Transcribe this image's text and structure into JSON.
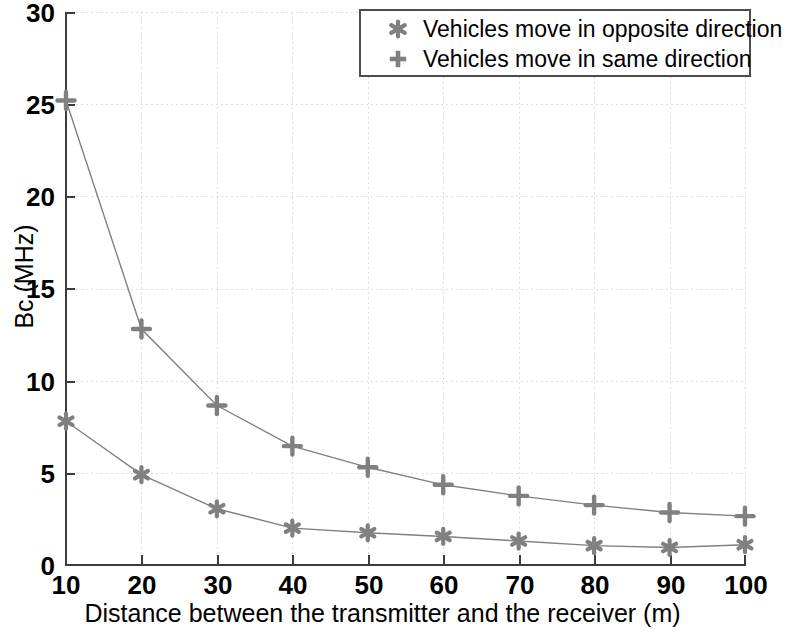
{
  "chart_data": {
    "type": "line",
    "title": "",
    "xlabel": "Distance between the transmitter and the receiver (m)",
    "ylabel": "Bc (MHz)",
    "xlim": [
      10,
      100
    ],
    "ylim": [
      0,
      30
    ],
    "xticks": [
      10,
      20,
      30,
      40,
      50,
      60,
      70,
      80,
      90,
      100
    ],
    "yticks": [
      0,
      5,
      10,
      15,
      20,
      25,
      30
    ],
    "grid": true,
    "legend_position": "top-right",
    "x": [
      10,
      20,
      30,
      40,
      50,
      60,
      70,
      80,
      90,
      100
    ],
    "series": [
      {
        "name": "Vehicles move in opposite direction",
        "marker": "hexagram",
        "color": "#808080",
        "values": [
          7.8,
          4.9,
          3.05,
          2.0,
          1.75,
          1.55,
          1.3,
          1.05,
          0.95,
          1.1
        ]
      },
      {
        "name": "Vehicles move in same direction",
        "marker": "plus",
        "color": "#808080",
        "values": [
          25.2,
          12.8,
          8.65,
          6.45,
          5.3,
          4.35,
          3.75,
          3.25,
          2.85,
          2.65
        ]
      }
    ]
  },
  "axes": {
    "y_tick_labels": [
      "30",
      "25",
      "20",
      "15",
      "10",
      "5",
      "0"
    ],
    "x_tick_labels": [
      "10",
      "20",
      "30",
      "40",
      "50",
      "60",
      "70",
      "80",
      "90",
      "100"
    ],
    "x_title": "Distance between the transmitter and the receiver (m)",
    "y_title": "Bc (MHz)"
  },
  "legend": {
    "entries": [
      {
        "label": "Vehicles move in opposite direction",
        "marker": "hexagram-marker"
      },
      {
        "label": "Vehicles move in same direction",
        "marker": "plus-marker"
      }
    ]
  },
  "colors": {
    "series": "#808080",
    "axis": "#3c3c3c",
    "grid": "#dddddd",
    "legend_border": "#4d4d4d",
    "background": "#ffffff"
  }
}
